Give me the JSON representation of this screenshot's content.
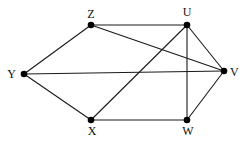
{
  "diagram": {
    "type": "graph",
    "nodes": [
      {
        "id": "Z",
        "label": "Z",
        "x": 91,
        "y": 25,
        "lx": 91,
        "ly": 18,
        "anchor": "middle"
      },
      {
        "id": "U",
        "label": "U",
        "x": 187,
        "y": 25,
        "lx": 187,
        "ly": 16,
        "anchor": "middle"
      },
      {
        "id": "Y",
        "label": "Y",
        "x": 24,
        "y": 74,
        "lx": 16,
        "ly": 78,
        "anchor": "end"
      },
      {
        "id": "V",
        "label": "V",
        "x": 224,
        "y": 71,
        "lx": 230,
        "ly": 76,
        "anchor": "start"
      },
      {
        "id": "X",
        "label": "X",
        "x": 91,
        "y": 120,
        "lx": 92,
        "ly": 135,
        "anchor": "middle"
      },
      {
        "id": "W",
        "label": "W",
        "x": 187,
        "y": 120,
        "lx": 188,
        "ly": 135,
        "anchor": "middle"
      }
    ],
    "edges": [
      [
        "Z",
        "U"
      ],
      [
        "Z",
        "V"
      ],
      [
        "Z",
        "Y"
      ],
      [
        "Y",
        "V"
      ],
      [
        "Y",
        "X"
      ],
      [
        "X",
        "U"
      ],
      [
        "X",
        "W"
      ],
      [
        "U",
        "V"
      ],
      [
        "U",
        "W"
      ],
      [
        "W",
        "V"
      ]
    ],
    "colors": {
      "edge": "#1a1a1a",
      "node": "#000000",
      "label": "#111111",
      "background": "#ffffff"
    }
  }
}
